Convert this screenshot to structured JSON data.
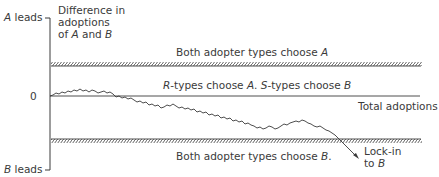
{
  "axis": {
    "y_title_line1": "Difference in",
    "y_title_line2": "adoptions",
    "y_title_line3_pre": "of ",
    "y_title_line3_a": "A",
    "y_title_line3_mid": " and ",
    "y_title_line3_b": "B",
    "top_label_var": "A",
    "top_label_rest": " leads",
    "bottom_label_var": "B",
    "bottom_label_rest": " leads",
    "zero_label": "0",
    "x_label": "Total adoptions"
  },
  "regions": {
    "top": {
      "pre": "Both adopter types choose ",
      "var": "A",
      "post": ""
    },
    "middle": {
      "r": "R",
      "text1": "-types choose ",
      "a": "A",
      "text2": ". ",
      "s": "S",
      "text3": "-types choose ",
      "b": "B"
    },
    "bottom": {
      "pre": "Both adopter types choose ",
      "var": "B",
      "post": "."
    }
  },
  "annotation": {
    "line1": "Lock-in",
    "line2_pre": "to ",
    "line2_var": "B"
  },
  "colors": {
    "line": "#3a3a3a",
    "text": "#3a3a3a",
    "background": "#ffffff"
  }
}
